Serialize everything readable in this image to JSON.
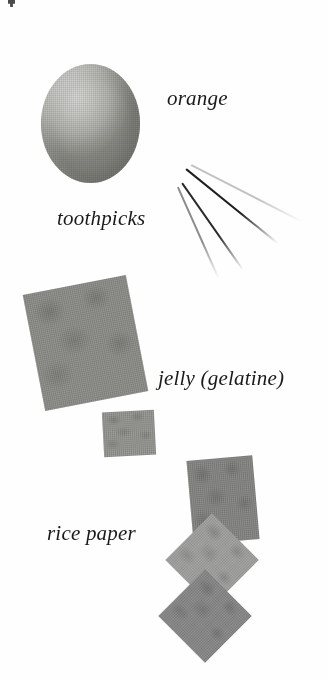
{
  "figure": {
    "kind": "photographic-plate",
    "background_color": "#ffffff",
    "width": 327,
    "height": 679
  },
  "labels": {
    "orange": "orange",
    "toothpicks": "toothpicks",
    "jelly": "jelly (gelatine)",
    "rice_paper": "rice paper"
  },
  "objects": {
    "orange": {
      "name": "orange",
      "shape": "sphere",
      "x": 41,
      "y": 64,
      "w": 99,
      "h": 119,
      "highlight_color": "#d8d8d6",
      "mid_color": "#b4b4b0",
      "shadow_color": "#8a8a85"
    },
    "toothpicks": [
      {
        "name": "toothpick-1",
        "x": 186,
        "y": 168,
        "length": 118,
        "angle": 39,
        "thickness": 2.0,
        "color": "#1f1f1f"
      },
      {
        "name": "toothpick-2",
        "x": 182,
        "y": 182,
        "length": 106,
        "angle": 55,
        "thickness": 2.2,
        "color": "#2b2b2b"
      },
      {
        "name": "toothpick-3",
        "x": 178,
        "y": 186,
        "length": 100,
        "angle": 66,
        "thickness": 1.6,
        "color": "#8c8c8c"
      },
      {
        "name": "toothpick-4",
        "x": 191,
        "y": 164,
        "length": 125,
        "angle": 27,
        "thickness": 1.8,
        "color": "#c2c2c2"
      }
    ],
    "jelly_sheets": [
      {
        "name": "jelly-sheet-large",
        "x": 33,
        "y": 284,
        "w": 105,
        "h": 118,
        "angle": -11,
        "color": "#848480"
      },
      {
        "name": "jelly-sheet-small",
        "x": 103,
        "y": 411,
        "w": 52,
        "h": 45,
        "angle": -3,
        "color": "#8c8c88"
      }
    ],
    "rice_paper_sheets": [
      {
        "name": "rice-paper-top",
        "x": 190,
        "y": 458,
        "w": 66,
        "h": 84,
        "angle": -5,
        "color": "#7c7c7a"
      },
      {
        "name": "rice-paper-middle",
        "x": 179,
        "y": 527,
        "w": 66,
        "h": 66,
        "angle": 45,
        "color": "#9a9a98"
      },
      {
        "name": "rice-paper-bottom",
        "x": 172,
        "y": 583,
        "w": 66,
        "h": 66,
        "angle": 45,
        "color": "#808080"
      }
    ]
  },
  "crop_fragment": {
    "name": "cropped-text-fragment",
    "x": 8,
    "y": 0,
    "w": 7,
    "h": 7,
    "color": "#2a2a2a"
  }
}
